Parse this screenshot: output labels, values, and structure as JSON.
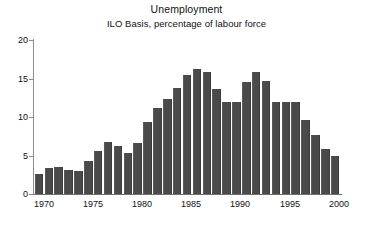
{
  "chart_data": {
    "type": "bar",
    "title": "Unemployment",
    "subtitle": "ILO Basis, percentage of labour force",
    "xlabel": "",
    "ylabel": "",
    "ylim": [
      0,
      20
    ],
    "yticks": [
      0,
      5,
      10,
      15,
      20
    ],
    "ytick_labels": [
      "0",
      "5",
      "10",
      "15",
      "20"
    ],
    "xtick_labels": [
      "1970",
      "1975",
      "1980",
      "1985",
      "1990",
      "1995",
      "2000"
    ],
    "xticks": [
      1970,
      1975,
      1980,
      1985,
      1990,
      1995,
      2000
    ],
    "grid": false,
    "legend": "none",
    "bar_color": "#4a4a4a",
    "axis_color": "#8d8d8d",
    "categories": [
      "1970",
      "1971",
      "1972",
      "1973",
      "1974",
      "1975",
      "1976",
      "1977",
      "1978",
      "1979",
      "1980",
      "1981",
      "1982",
      "1983",
      "1984",
      "1985",
      "1986",
      "1987",
      "1988",
      "1989",
      "1990",
      "1991",
      "1992",
      "1993",
      "1994",
      "1995",
      "1996",
      "1997",
      "1998",
      "1999",
      "2000"
    ],
    "values": [
      2.6,
      3.4,
      3.5,
      3.1,
      3.0,
      4.3,
      5.6,
      6.8,
      6.3,
      5.3,
      6.6,
      9.4,
      11.2,
      12.3,
      13.8,
      15.5,
      16.2,
      15.9,
      13.6,
      12.0,
      12.0,
      14.6,
      15.8,
      14.7,
      12.0,
      11.9,
      11.9,
      9.6,
      7.6,
      5.9,
      4.9
    ],
    "ytick_pixel_top": {
      "20": 40,
      "15": 78.5,
      "10": 117,
      "5": 155.5,
      "0": 194
    },
    "xtick_pixel_x": {
      "1970": 44,
      "1975": 93,
      "1980": 142,
      "1985": 191,
      "1990": 240,
      "1995": 290,
      "2000": 339
    }
  }
}
